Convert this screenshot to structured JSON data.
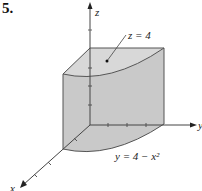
{
  "problem_number": "5.",
  "axes": {
    "x_label": "x",
    "y_label": "y",
    "z_label": "z"
  },
  "labels": {
    "top_surface": "z = 4",
    "boundary_curve": "y = 4 − x²"
  },
  "colors": {
    "face_fill": "#cfcfcf",
    "top_fill": "#d6d6d6",
    "base_fill": "#ececec",
    "edge": "#555555",
    "axis": "#444444"
  }
}
